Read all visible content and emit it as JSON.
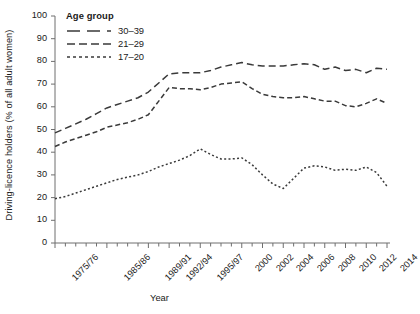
{
  "chart_data": {
    "type": "line",
    "title": "",
    "xlabel": "Year",
    "ylabel": "Driving-licence holders (% of all adult women)",
    "ylim": [
      0,
      100
    ],
    "ytick_step": 10,
    "yticks": [
      "0",
      "10",
      "20",
      "30",
      "40",
      "50",
      "60",
      "70",
      "80",
      "90",
      "100"
    ],
    "grid": false,
    "legend_position": "top-left",
    "legend_title": "Age group",
    "x": [
      "1975/76",
      "1977/79",
      "1979/81",
      "1981/83",
      "1983/85",
      "1985/86",
      "1986/87",
      "1987/88",
      "1988/89",
      "1989/91",
      "1991/93",
      "1992/94",
      "1993/95",
      "1994/96",
      "1995/97",
      "1996/98",
      "1998",
      "1999",
      "2000",
      "2001",
      "2002",
      "2003",
      "2004",
      "2005",
      "2006",
      "2007",
      "2008",
      "2009",
      "2010",
      "2011",
      "2012",
      "2013",
      "2014"
    ],
    "xtick_labels_shown": [
      "1975/76",
      "1985/86",
      "1989/91",
      "1992/94",
      "1995/97",
      "2000",
      "2002",
      "2004",
      "2006",
      "2008",
      "2010",
      "2012",
      "2014"
    ],
    "series": [
      {
        "name": "30-39",
        "label": "30–39",
        "dash": "long",
        "color": "#3a3a3a",
        "values": [
          48.5,
          50.5,
          52.5,
          54.5,
          57.0,
          59.5,
          61.0,
          62.5,
          64.0,
          66.5,
          70.5,
          74.5,
          75.0,
          75.0,
          75.0,
          76.0,
          77.5,
          78.5,
          79.5,
          78.5,
          78.0,
          78.0,
          78.0,
          78.5,
          79.0,
          78.5,
          76.5,
          77.5,
          76.0,
          76.5,
          75.0,
          77.0,
          76.5
        ]
      },
      {
        "name": "21-29",
        "label": "21–29",
        "dash": "medium",
        "color": "#3a3a3a",
        "values": [
          42.5,
          44.5,
          46.0,
          47.5,
          49.0,
          51.0,
          52.0,
          53.0,
          54.5,
          56.5,
          62.5,
          68.5,
          68.0,
          68.0,
          67.5,
          68.5,
          70.0,
          70.5,
          71.0,
          68.0,
          65.5,
          64.5,
          64.0,
          64.0,
          64.5,
          63.5,
          62.5,
          62.5,
          60.5,
          60.0,
          61.5,
          63.5,
          61.5
        ]
      },
      {
        "name": "17-20",
        "label": "17–20",
        "dash": "dotted",
        "color": "#3a3a3a",
        "values": [
          19.5,
          20.5,
          22.0,
          23.5,
          25.0,
          26.5,
          28.0,
          29.0,
          30.0,
          31.5,
          33.5,
          35.0,
          36.5,
          38.5,
          41.5,
          39.0,
          37.0,
          37.0,
          37.5,
          34.5,
          30.0,
          26.0,
          24.0,
          28.5,
          33.0,
          34.0,
          33.5,
          32.0,
          32.5,
          32.0,
          33.5,
          31.0,
          25.0
        ]
      }
    ]
  },
  "axes": {
    "y_title": "Driving-licence holders (% of all adult women)",
    "x_title": "Year"
  },
  "legend": {
    "title": "Age group",
    "entries": [
      {
        "label": "30–39"
      },
      {
        "label": "21–29"
      },
      {
        "label": "17–20"
      }
    ]
  }
}
